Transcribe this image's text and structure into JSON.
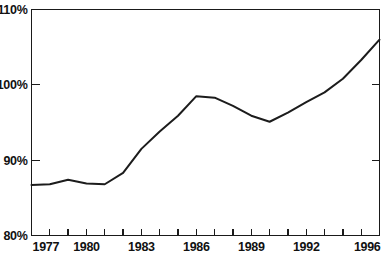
{
  "chart_data": {
    "type": "line",
    "title": "",
    "xlabel": "",
    "ylabel": "",
    "x": [
      1977,
      1978,
      1979,
      1980,
      1981,
      1982,
      1983,
      1984,
      1985,
      1986,
      1987,
      1988,
      1989,
      1990,
      1991,
      1992,
      1993,
      1994,
      1995,
      1996
    ],
    "values": [
      86.7,
      86.8,
      87.4,
      86.9,
      86.8,
      88.3,
      91.5,
      93.8,
      95.9,
      98.5,
      98.3,
      97.2,
      95.9,
      95.1,
      96.3,
      97.7,
      99.0,
      100.8,
      103.3,
      106.0
    ],
    "series": [
      {
        "name": "index",
        "values": [
          86.7,
          86.8,
          87.4,
          86.9,
          86.8,
          88.3,
          91.5,
          93.8,
          95.9,
          98.5,
          98.3,
          97.2,
          95.9,
          95.1,
          96.3,
          97.7,
          99.0,
          100.8,
          103.3,
          106.0
        ]
      }
    ],
    "ylim": [
      80,
      110
    ],
    "xlim": [
      1977,
      1996
    ],
    "ytick_labels": [
      "110%",
      "100%",
      "90%",
      "80%"
    ],
    "ytick_values": [
      110,
      100,
      90,
      80
    ],
    "xtick_values": [
      1977,
      1978,
      1979,
      1980,
      1981,
      1982,
      1983,
      1984,
      1985,
      1986,
      1987,
      1988,
      1989,
      1990,
      1991,
      1992,
      1993,
      1994,
      1995,
      1996
    ],
    "xtick_labels": [
      "1977",
      "1980",
      "1983",
      "1986",
      "1989",
      "1992",
      "1996"
    ],
    "xtick_label_values": [
      1977,
      1980,
      1983,
      1986,
      1989,
      1992,
      1996
    ],
    "grid": false,
    "legend": false,
    "legend_position": "none",
    "line_color": "#1c1c1c",
    "axis_color": "#1a1a1a",
    "background_color": "#ffffff"
  }
}
